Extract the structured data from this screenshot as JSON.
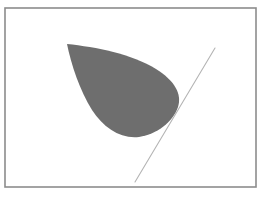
{
  "figure": {
    "title": "",
    "canvas": {
      "width": 265,
      "height": 197,
      "background": "#ffffff"
    },
    "frame": {
      "name": "figure-border",
      "x": 5,
      "y": 8,
      "width": 251,
      "height": 179,
      "stroke": "#8c8c8c",
      "stroke_width": 1.6,
      "fill": "none"
    },
    "teardrop": {
      "name": "teardrop-shape",
      "fill": "#6e6e6e",
      "stroke": "none",
      "tip": {
        "x": 67,
        "y": 44
      },
      "rightmost": {
        "x": 180,
        "y": 97
      },
      "bottom": {
        "x": 140,
        "y": 137
      },
      "path": "M 67 44 C 96 47 132 54 156 69 C 175 81 182 94 178 107 C 173 122 157 134 139 137 C 120 139 104 128 92 110 C 80 91 71 64 67 44 Z"
    },
    "tangent_line": {
      "name": "tangent-line",
      "stroke": "#b4b4b4",
      "stroke_width": 1.1,
      "x1": 215,
      "y1": 48,
      "x2": 135,
      "y2": 182
    }
  },
  "chart_data": {
    "type": "scatter",
    "title": "",
    "xlabel": "",
    "ylabel": "",
    "xlim": [
      5,
      256
    ],
    "ylim": [
      8,
      187
    ],
    "grid": false,
    "legend": "none",
    "series": [
      {
        "name": "teardrop-region",
        "kind": "filled-closed-curve",
        "color": "#6e6e6e",
        "vertices": [
          [
            67,
            44
          ],
          [
            96,
            47
          ],
          [
            132,
            54
          ],
          [
            156,
            69
          ],
          [
            175,
            81
          ],
          [
            182,
            94
          ],
          [
            178,
            107
          ],
          [
            173,
            122
          ],
          [
            157,
            134
          ],
          [
            139,
            137
          ],
          [
            120,
            139
          ],
          [
            104,
            128
          ],
          [
            92,
            110
          ],
          [
            80,
            91
          ],
          [
            71,
            64
          ],
          [
            67,
            44
          ]
        ]
      },
      {
        "name": "tangent-line",
        "kind": "line-segment",
        "color": "#b4b4b4",
        "x": [
          215,
          135
        ],
        "y": [
          48,
          182
        ]
      }
    ]
  }
}
